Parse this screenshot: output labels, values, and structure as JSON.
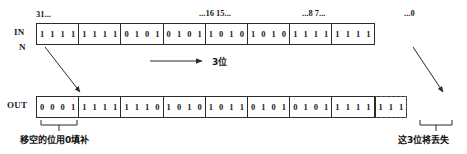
{
  "diagram": {
    "bit_index_labels": [
      {
        "text": "31...",
        "x": 36,
        "y": 9
      },
      {
        "text": "...16 15...",
        "x": 199,
        "y": 8
      },
      {
        "text": "...8 7...",
        "x": 302,
        "y": 8
      },
      {
        "text": "...0",
        "x": 404,
        "y": 8
      }
    ],
    "input_row": {
      "label": "IN",
      "label_second_line": "N",
      "nibbles": [
        [
          "1",
          "1",
          "1",
          "1"
        ],
        [
          "1",
          "1",
          "1",
          "1"
        ],
        [
          "0",
          "1",
          "0",
          "1"
        ],
        [
          "0",
          "1",
          "0",
          "1"
        ],
        [
          "1",
          "0",
          "1",
          "0"
        ],
        [
          "1",
          "0",
          "1",
          "0"
        ],
        [
          "1",
          "1",
          "1",
          "1"
        ],
        [
          "1",
          "1",
          "1",
          "1"
        ]
      ]
    },
    "output_row": {
      "label": "OUT",
      "nibbles": [
        [
          "0",
          "0",
          "0",
          "1"
        ],
        [
          "1",
          "1",
          "1",
          "1"
        ],
        [
          "1",
          "1",
          "1",
          "0"
        ],
        [
          "1",
          "0",
          "1",
          "0"
        ],
        [
          "1",
          "0",
          "1",
          "1"
        ],
        [
          "0",
          "1",
          "0",
          "1"
        ],
        [
          "0",
          "1",
          "0",
          "1"
        ],
        [
          "1",
          "1",
          "1",
          "1"
        ]
      ],
      "discarded_nibble": [
        "1",
        "1",
        "1"
      ]
    },
    "shift_arrow": {
      "label": "3位",
      "direction": "right"
    },
    "captions": {
      "fill_zeros": "移空的位用0填补",
      "bits_lost": "这3位将丢失"
    },
    "colors": {
      "stroke": "#2b2b2b",
      "dashed_stroke": "#555555",
      "text": "#1b1b1b",
      "background": "#ffffff"
    }
  }
}
